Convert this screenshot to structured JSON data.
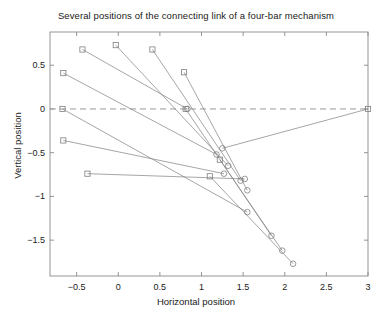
{
  "chart_data": {
    "type": "line",
    "title": "Several positions of the connecting link of a four-bar mechanism",
    "xlabel": "Horizontal position",
    "ylabel": "Vertical position",
    "xlim": [
      -0.82,
      3.0
    ],
    "ylim": [
      -1.91,
      0.88
    ],
    "grid": false,
    "legend": null,
    "xticks": [
      -0.5,
      0,
      0.5,
      1,
      1.5,
      2,
      2.5,
      3
    ],
    "xtick_labels": [
      "-0.5",
      "0",
      "0.5",
      "1",
      "1.5",
      "2",
      "2.5",
      "3"
    ],
    "yticks": [
      0.5,
      0,
      -0.5,
      -1,
      -1.5
    ],
    "ytick_labels": [
      "0.5",
      "0",
      "-0.5",
      "-1",
      "-1.5"
    ],
    "reference_line": {
      "orientation": "horizontal",
      "y": 0,
      "style": "dashed",
      "color": "#999999"
    },
    "marker_start": "square",
    "marker_end": "circle",
    "line_color": "#7f7f7f",
    "marker_color": "#7f7f7f",
    "series": [
      {
        "name": "position-1",
        "x": [
          -0.66,
          1.18
        ],
        "y": [
          0.41,
          -0.52
        ]
      },
      {
        "name": "position-2",
        "x": [
          -0.43,
          0.83
        ],
        "y": [
          0.68,
          0.0
        ]
      },
      {
        "name": "position-3",
        "x": [
          -0.03,
          1.32
        ],
        "y": [
          0.73,
          -0.65
        ]
      },
      {
        "name": "position-4",
        "x": [
          0.41,
          1.47
        ],
        "y": [
          0.68,
          -0.82
        ]
      },
      {
        "name": "position-5",
        "x": [
          0.79,
          1.55
        ],
        "y": [
          0.42,
          -0.93
        ]
      },
      {
        "name": "position-6",
        "x": [
          0.81,
          1.84
        ],
        "y": [
          0.0,
          -1.45
        ]
      },
      {
        "name": "position-7",
        "x": [
          -0.67,
          1.55
        ],
        "y": [
          0.0,
          -1.18
        ]
      },
      {
        "name": "position-8",
        "x": [
          -0.66,
          1.27
        ],
        "y": [
          -0.36,
          -0.74
        ]
      },
      {
        "name": "position-9",
        "x": [
          -0.37,
          1.52
        ],
        "y": [
          -0.74,
          -0.8
        ]
      },
      {
        "name": "position-10",
        "x": [
          1.1,
          2.1
        ],
        "y": [
          -0.77,
          -1.77
        ]
      },
      {
        "name": "position-11",
        "x": [
          1.22,
          1.97
        ],
        "y": [
          -0.58,
          -1.62
        ]
      },
      {
        "name": "position-12",
        "x": [
          3.0,
          1.25
        ],
        "y": [
          0.0,
          -0.45
        ]
      }
    ],
    "markers_start": [
      {
        "x": -0.66,
        "y": 0.41
      },
      {
        "x": -0.43,
        "y": 0.68
      },
      {
        "x": -0.03,
        "y": 0.73
      },
      {
        "x": 0.41,
        "y": 0.68
      },
      {
        "x": 0.79,
        "y": 0.42
      },
      {
        "x": 0.81,
        "y": 0.0
      },
      {
        "x": -0.67,
        "y": 0.0
      },
      {
        "x": -0.66,
        "y": -0.36
      },
      {
        "x": -0.37,
        "y": -0.74
      },
      {
        "x": 1.1,
        "y": -0.77
      },
      {
        "x": 1.22,
        "y": -0.58
      },
      {
        "x": 3.0,
        "y": 0.0
      }
    ],
    "markers_end": [
      {
        "x": 1.18,
        "y": -0.52
      },
      {
        "x": 0.83,
        "y": 0.0
      },
      {
        "x": 1.32,
        "y": -0.65
      },
      {
        "x": 1.47,
        "y": -0.82
      },
      {
        "x": 1.55,
        "y": -0.93
      },
      {
        "x": 1.84,
        "y": -1.45
      },
      {
        "x": 1.55,
        "y": -1.18
      },
      {
        "x": 1.27,
        "y": -0.74
      },
      {
        "x": 1.52,
        "y": -0.8
      },
      {
        "x": 2.1,
        "y": -1.77
      },
      {
        "x": 1.97,
        "y": -1.62
      },
      {
        "x": 1.25,
        "y": -0.45
      }
    ]
  }
}
